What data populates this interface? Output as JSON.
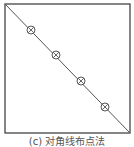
{
  "diagram": {
    "caption": "(c) 对角线布点法",
    "frame": {
      "x": 5,
      "y": 4,
      "width": 125,
      "height": 129,
      "stroke": "#444444"
    },
    "diagonal": {
      "x1": 5,
      "y1": 4,
      "x2": 130,
      "y2": 133,
      "stroke": "#555555"
    },
    "sample_points": [
      {
        "cx": 31,
        "cy": 30,
        "r": 4
      },
      {
        "cx": 56,
        "cy": 55,
        "r": 4
      },
      {
        "cx": 81,
        "cy": 81,
        "r": 4
      },
      {
        "cx": 105,
        "cy": 107,
        "r": 4
      }
    ],
    "point_marker": "circle-with-x",
    "point_color": "#555555"
  }
}
